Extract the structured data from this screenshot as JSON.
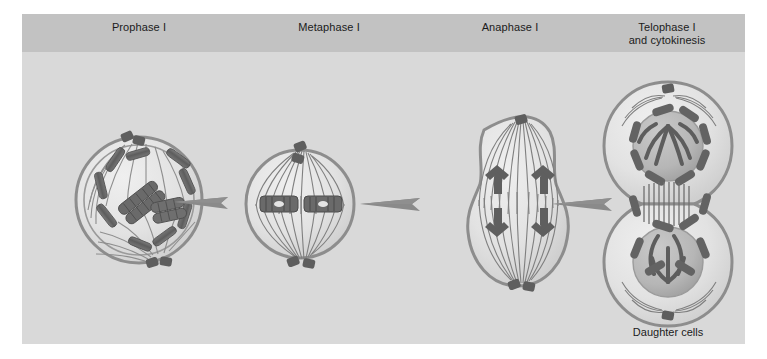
{
  "figure": {
    "background_color": "#d9d9d9",
    "header_band_color": "#c2c2c2",
    "title_text_color": "#1b1b1b"
  },
  "header": {
    "phases": [
      {
        "id": "prophase-i",
        "label": "Prophase I"
      },
      {
        "id": "metaphase-i",
        "label": "Metaphase I"
      },
      {
        "id": "anaphase-i",
        "label": "Anaphase I"
      },
      {
        "id": "telophase-i",
        "label_line1": "Telophase I",
        "label_line2": "and cytokinesis"
      }
    ]
  },
  "captions": {
    "daughter_cells": "Daughter cells"
  },
  "diagram": {
    "type": "biology-process-diagram",
    "stage_count": 4,
    "arrow_count": 3,
    "colors": {
      "cell_membrane": "#8d8d8d",
      "cytoplasm": "#e6e6e6",
      "nucleus": "#b9b9b9",
      "chromosome": "#6b6b6b",
      "spindle_fiber": "#7a7a7a",
      "centriole": "#5e5e5e",
      "arrow": "#8a8a8a"
    },
    "stages": [
      {
        "name": "Prophase I",
        "cell_shape": "round",
        "nuclear_envelope": "breaking down",
        "chromosomes": "tetrads condensed, crossing over visible",
        "chromosome_count": 12,
        "centrioles": 2,
        "spindle": "forming asters"
      },
      {
        "name": "Metaphase I",
        "cell_shape": "round",
        "nuclear_envelope": "absent",
        "chromosomes": "homologous pairs aligned at metaphase plate",
        "chromosome_count": 2,
        "centrioles": 4,
        "spindle": "full spindle, pole to pole fibers"
      },
      {
        "name": "Anaphase I",
        "cell_shape": "elongated with furrow",
        "nuclear_envelope": "absent",
        "chromosomes": "homologues migrating to opposite poles",
        "chromosome_count": 4,
        "centrioles": 3,
        "spindle": "shortening kinetochore fibers"
      },
      {
        "name": "Telophase I and cytokinesis",
        "cell_shape": "two daughter cells dividing",
        "nuclear_envelope": "reforming",
        "chromosomes": "decondensing at each pole",
        "chromosome_count": 16,
        "centrioles": 2,
        "spindle": "midbody remnant between cells"
      }
    ],
    "arrows": [
      {
        "from": "Prophase I",
        "to": "Metaphase I"
      },
      {
        "from": "Metaphase I",
        "to": "Anaphase I"
      },
      {
        "from": "Anaphase I",
        "to": "Telophase I and cytokinesis"
      }
    ]
  }
}
